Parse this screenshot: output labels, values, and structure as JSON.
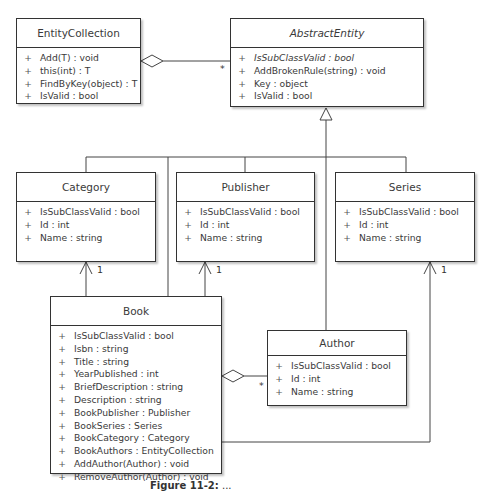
{
  "classes": {
    "entity_collection": {
      "name": "EntityCollection",
      "abstract": false,
      "members": [
        {
          "vis": "+",
          "text": "Add(T) : void"
        },
        {
          "vis": "+",
          "text": "this(int) : T"
        },
        {
          "vis": "+",
          "text": "FindByKey(object) : T"
        },
        {
          "vis": "+",
          "text": "IsValid : bool"
        }
      ]
    },
    "abstract_entity": {
      "name": "AbstractEntity",
      "abstract": true,
      "members": [
        {
          "vis": "+",
          "text": "IsSubClassValid : bool",
          "italic": true
        },
        {
          "vis": "+",
          "text": "AddBrokenRule(string) : void"
        },
        {
          "vis": "+",
          "text": "Key : object"
        },
        {
          "vis": "+",
          "text": "IsValid : bool"
        }
      ]
    },
    "category": {
      "name": "Category",
      "members": [
        {
          "vis": "+",
          "text": "IsSubClassValid : bool"
        },
        {
          "vis": "+",
          "text": "Id : int"
        },
        {
          "vis": "+",
          "text": "Name : string"
        }
      ]
    },
    "publisher": {
      "name": "Publisher",
      "members": [
        {
          "vis": "+",
          "text": "IsSubClassValid : bool"
        },
        {
          "vis": "+",
          "text": "Id : int"
        },
        {
          "vis": "+",
          "text": "Name : string"
        }
      ]
    },
    "series": {
      "name": "Series",
      "members": [
        {
          "vis": "+",
          "text": "IsSubClassValid : bool"
        },
        {
          "vis": "+",
          "text": "Id : int"
        },
        {
          "vis": "+",
          "text": "Name : string"
        }
      ]
    },
    "book": {
      "name": "Book",
      "members": [
        {
          "vis": "+",
          "text": "IsSubClassValid : bool"
        },
        {
          "vis": "+",
          "text": "Isbn : string"
        },
        {
          "vis": "+",
          "text": "Title : string"
        },
        {
          "vis": "+",
          "text": "YearPublished : int"
        },
        {
          "vis": "+",
          "text": "BriefDescription : string"
        },
        {
          "vis": "+",
          "text": "Description : string"
        },
        {
          "vis": "+",
          "text": "BookPublisher : Publisher"
        },
        {
          "vis": "+",
          "text": "BookSeries : Series"
        },
        {
          "vis": "+",
          "text": "BookCategory : Category"
        },
        {
          "vis": "+",
          "text": "BookAuthors : EntityCollection"
        },
        {
          "vis": "+",
          "text": "AddAuthor(Author) : void"
        },
        {
          "vis": "+",
          "text": "RemoveAuthor(Author) : void"
        }
      ]
    },
    "author": {
      "name": "Author",
      "members": [
        {
          "vis": "+",
          "text": "IsSubClassValid : bool"
        },
        {
          "vis": "+",
          "text": "Id : int"
        },
        {
          "vis": "+",
          "text": "Name : string"
        }
      ]
    }
  },
  "relationships": [
    {
      "type": "aggregation",
      "from": "EntityCollection",
      "to": "AbstractEntity",
      "multiplicity_to": "*"
    },
    {
      "type": "generalization",
      "from": [
        "Category",
        "Publisher",
        "Series",
        "Book",
        "Author"
      ],
      "to": "AbstractEntity"
    },
    {
      "type": "association",
      "from": "Book",
      "to": "Category",
      "multiplicity_to": "1"
    },
    {
      "type": "association",
      "from": "Book",
      "to": "Publisher",
      "multiplicity_to": "1"
    },
    {
      "type": "association",
      "from": "Book",
      "to": "Series",
      "multiplicity_to": "1"
    },
    {
      "type": "aggregation",
      "from": "Book",
      "to": "Author",
      "multiplicity_to": "*"
    }
  ],
  "multiplicities": {
    "ec_abstract": "*",
    "category": "1",
    "publisher": "1",
    "series": "1",
    "book_author": "*"
  },
  "caption": {
    "label": "Figure 11-2:",
    "text": "..."
  }
}
